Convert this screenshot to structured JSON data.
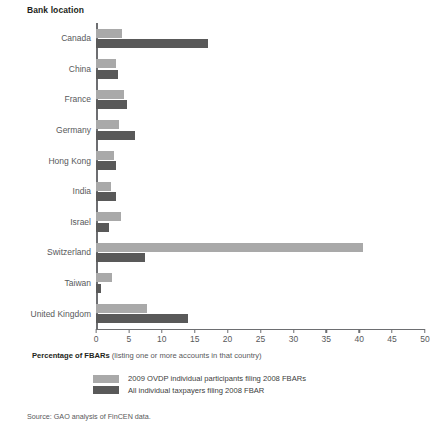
{
  "chart_data": {
    "type": "bar",
    "orientation": "horizontal",
    "title": "",
    "category_axis_title": "Bank location",
    "xlabel_bold": "Percentage of FBARs",
    "xlabel_rest": " (listing one or more accounts in that country)",
    "ylabel": "Bank location",
    "xlim": [
      0,
      50
    ],
    "xticks": [
      0,
      5,
      10,
      15,
      20,
      25,
      30,
      35,
      40,
      45,
      50
    ],
    "xtick_labels": [
      "0",
      "5",
      "10",
      "15",
      "20",
      "25",
      "30",
      "35",
      "40",
      "45",
      "50"
    ],
    "grid": false,
    "legend_position": "bottom-left",
    "categories": [
      "Canada",
      "China",
      "France",
      "Germany",
      "Hong Kong",
      "India",
      "Israel",
      "Switzerland",
      "Taiwan",
      "United Kingdom"
    ],
    "series": [
      {
        "name": "2009 OVDP individual participants filing 2008 FBARs",
        "color": "#a9a9a9",
        "values": [
          4.0,
          3.0,
          4.3,
          3.5,
          2.7,
          2.3,
          3.8,
          40.6,
          2.5,
          7.8
        ]
      },
      {
        "name": "All individual taxpayers filing 2008 FBAR",
        "color": "#595959",
        "values": [
          17.0,
          3.4,
          4.7,
          5.9,
          3.0,
          3.0,
          1.9,
          7.4,
          0.8,
          14.0
        ]
      }
    ],
    "source_note": "Source: GAO analysis of FinCEN data."
  },
  "legend": {
    "items": [
      {
        "label": "2009 OVDP individual participants filing 2008 FBARs",
        "swatch": "light"
      },
      {
        "label": "All individual taxpayers filing 2008 FBAR",
        "swatch": "dark"
      }
    ]
  },
  "colors": {
    "light_series": "#a9a9a9",
    "dark_series": "#595959",
    "axis": "#6d6e71",
    "text": "#58595b",
    "heading": "#231f20",
    "background": "#ffffff"
  }
}
